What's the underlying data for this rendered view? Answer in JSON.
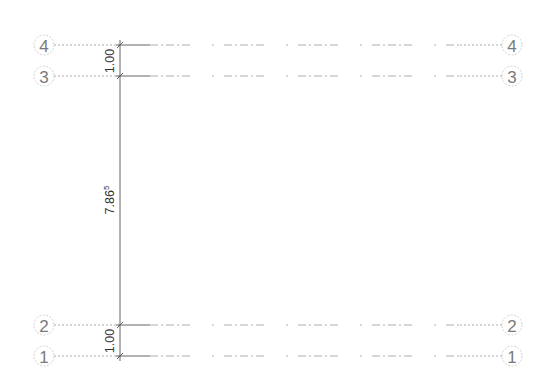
{
  "drawing": {
    "type": "grid-levels-elevation",
    "grids": [
      {
        "label": "4",
        "y": 45
      },
      {
        "label": "3",
        "y": 76
      },
      {
        "label": "2",
        "y": 325
      },
      {
        "label": "1",
        "y": 356
      }
    ],
    "bubble_left_x": 44,
    "bubble_right_x": 512,
    "bubble_radius": 10,
    "dimension_line_x": 120,
    "dimensions": [
      {
        "from": "4",
        "to": "3",
        "value": "1.00",
        "superscript": ""
      },
      {
        "from": "3",
        "to": "2",
        "value": "7.86",
        "superscript": "5"
      },
      {
        "from": "2",
        "to": "1",
        "value": "1.00",
        "superscript": ""
      }
    ],
    "colors": {
      "grid_line": "#9a9a9a",
      "bubble_stroke": "#c4c4c4",
      "bubble_text": "#7a7a7a",
      "dimension": "#555555",
      "background": "#ffffff"
    }
  },
  "labels": {
    "grid_4_left": "4",
    "grid_3_left": "3",
    "grid_2_left": "2",
    "grid_1_left": "1",
    "grid_4_right": "4",
    "grid_3_right": "3",
    "grid_2_right": "2",
    "grid_1_right": "1",
    "dim_top": "1.00",
    "dim_middle": "7.86",
    "dim_middle_sup": "5",
    "dim_bottom": "1.00"
  }
}
